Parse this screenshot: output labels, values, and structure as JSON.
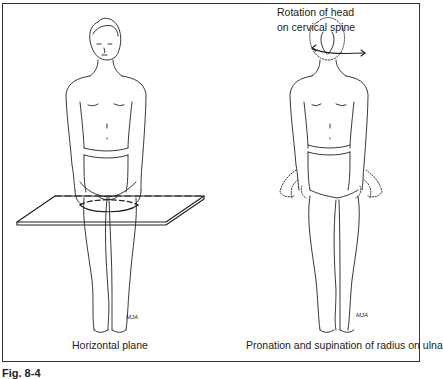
{
  "figure": {
    "caption": "Fig. 8-4",
    "panels": [
      {
        "label": "Horizontal plane",
        "signature": "MJA"
      },
      {
        "label": "Pronation and supination of radius on ulna",
        "signature": "MJA"
      }
    ],
    "annotation": {
      "line1": "Rotation of head",
      "line2": "on cervical spine"
    },
    "colors": {
      "ink": "#1a1a1a",
      "background": "#ffffff"
    }
  }
}
